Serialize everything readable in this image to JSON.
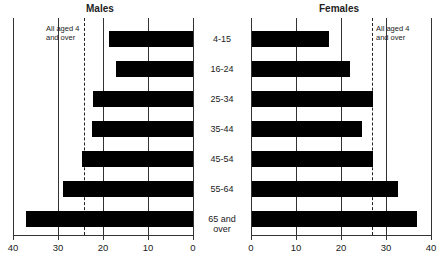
{
  "chart_data": [
    {
      "type": "bar",
      "orientation": "horizontal",
      "title": "Males",
      "categories": [
        "4-15",
        "16-24",
        "25-34",
        "35-44",
        "45-54",
        "55-64",
        "65 and over"
      ],
      "values": [
        18.7,
        17.1,
        22.2,
        22.4,
        24.7,
        28.9,
        37.1
      ],
      "reference_line": {
        "label": "All aged 4 and over",
        "value": 24.2
      },
      "xlim": [
        40,
        0
      ],
      "xticks": [
        40,
        30,
        20,
        10,
        0
      ],
      "grid": true,
      "direction": "reversed"
    },
    {
      "type": "bar",
      "orientation": "horizontal",
      "title": "Females",
      "categories": [
        "4-15",
        "16-24",
        "25-34",
        "35-44",
        "45-54",
        "55-64",
        "65 and over"
      ],
      "values": [
        17.1,
        21.8,
        26.9,
        24.4,
        26.9,
        32.4,
        36.7
      ],
      "reference_line": {
        "label": "All aged 4 and over",
        "value": 26.9
      },
      "xlim": [
        0,
        40
      ],
      "xticks": [
        0,
        10,
        20,
        30,
        40
      ],
      "grid": true
    }
  ],
  "labels": {
    "males": "Males",
    "females": "Females",
    "ref_line1": "All aged 4",
    "ref_line2": "and over",
    "categories": [
      "4-15",
      "16-24",
      "25-34",
      "35-44",
      "45-54",
      "55-64",
      "65 and over"
    ],
    "left_ticks": [
      "40",
      "30",
      "20",
      "10",
      "0"
    ],
    "right_ticks": [
      "0",
      "10",
      "20",
      "30",
      "40"
    ]
  }
}
